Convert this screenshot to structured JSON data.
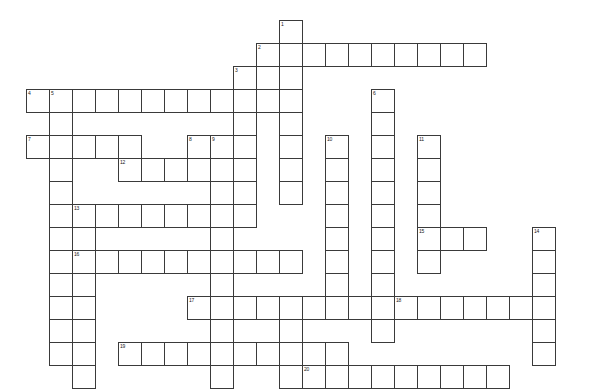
{
  "puzzle": {
    "title": "Crossword Puzzle Grid",
    "cell_size": 23,
    "origin_x": 26,
    "origin_y": 20,
    "cell_fill_color": "#ffffff",
    "cell_border_color": "#3a3a3a",
    "number_color": "#1a1a1a",
    "background_color": "#ffffff",
    "columns": 24,
    "rows": 16,
    "entry_count": 20,
    "entries": [
      {
        "number": "1",
        "direction": "down",
        "col": 11,
        "row": 0,
        "length": 8
      },
      {
        "number": "2",
        "direction": "across",
        "col": 10,
        "row": 1,
        "length": 10
      },
      {
        "number": "3",
        "direction": "down",
        "col": 9,
        "row": 2,
        "length": 6
      },
      {
        "number": "4",
        "direction": "across",
        "col": 0,
        "row": 3,
        "length": 11
      },
      {
        "number": "5",
        "direction": "down",
        "col": 1,
        "row": 3,
        "length": 6
      },
      {
        "number": "6",
        "direction": "down",
        "col": 15,
        "row": 3,
        "length": 11
      },
      {
        "number": "7",
        "direction": "across",
        "col": 0,
        "row": 5,
        "length": 5
      },
      {
        "number": "8",
        "direction": "across",
        "col": 7,
        "row": 5,
        "length": 2
      },
      {
        "number": "9",
        "direction": "down",
        "col": 8,
        "row": 5,
        "length": 10
      },
      {
        "number": "10",
        "direction": "down",
        "col": 13,
        "row": 5,
        "length": 8
      },
      {
        "number": "11",
        "direction": "down",
        "col": 17,
        "row": 5,
        "length": 6
      },
      {
        "number": "12",
        "direction": "across",
        "col": 4,
        "row": 6,
        "length": 6
      },
      {
        "number": "13",
        "direction": "across",
        "col": 2,
        "row": 8,
        "length": 8
      },
      {
        "number": "14",
        "direction": "down",
        "col": 22,
        "row": 9,
        "length": 6
      },
      {
        "number": "15",
        "direction": "across",
        "col": 17,
        "row": 9,
        "length": 3
      },
      {
        "number": "16",
        "direction": "across",
        "col": 2,
        "row": 10,
        "length": 10
      },
      {
        "number": "17",
        "direction": "across",
        "col": 7,
        "row": 12,
        "length": 14
      },
      {
        "number": "18",
        "direction": "across",
        "col": 16,
        "row": 12,
        "length": 7
      },
      {
        "number": "19",
        "direction": "across",
        "col": 4,
        "row": 14,
        "length": 10
      },
      {
        "number": "20",
        "direction": "across",
        "col": 12,
        "row": 15,
        "length": 9
      }
    ],
    "extra_cells": [
      {
        "col": 1,
        "row": 9
      },
      {
        "col": 1,
        "row": 10
      },
      {
        "col": 1,
        "row": 11
      },
      {
        "col": 1,
        "row": 12
      },
      {
        "col": 1,
        "row": 13
      },
      {
        "col": 1,
        "row": 14
      },
      {
        "col": 2,
        "row": 9
      },
      {
        "col": 2,
        "row": 11
      },
      {
        "col": 2,
        "row": 12
      },
      {
        "col": 2,
        "row": 13
      },
      {
        "col": 2,
        "row": 14
      },
      {
        "col": 2,
        "row": 15
      },
      {
        "col": 11,
        "row": 13
      },
      {
        "col": 11,
        "row": 14
      },
      {
        "col": 11,
        "row": 15
      },
      {
        "col": 8,
        "row": 15
      }
    ]
  }
}
